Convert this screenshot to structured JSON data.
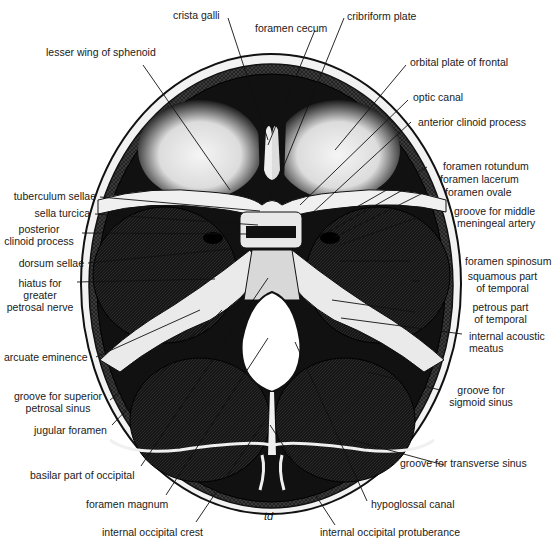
{
  "figure": {
    "signature": "td",
    "colors": {
      "ink": "#111111",
      "bone": "#f4f4f4",
      "background": "#ffffff",
      "label": "#1a1a1a"
    }
  },
  "labels": {
    "crista_galli": "crista galli",
    "foramen_cecum": "foramen cecum",
    "cribriform_plate": "cribriform plate",
    "lesser_wing": "lesser wing of sphenoid",
    "orbital_plate": "orbital plate of frontal",
    "optic_canal": "optic canal",
    "anterior_clinoid": "anterior clinoid process",
    "foramen_rotundum": "foramen rotundum",
    "foramen_lacerum": "foramen lacerum",
    "foramen_ovale": "foramen ovale",
    "groove_mma_1": "groove for middle",
    "groove_mma_2": "meningeal artery",
    "tuberculum_sellae": "tuberculum sellae",
    "sella_turcica": "sella turcica",
    "posterior_clinoid_1": "posterior",
    "posterior_clinoid_2": "clinoid process",
    "dorsum_sellae": "dorsum sellae",
    "hiatus_1": "hiatus for",
    "hiatus_2": "greater",
    "hiatus_3": "petrosal nerve",
    "foramen_spinosum": "foramen spinosum",
    "squamous_1": "squamous part",
    "squamous_2": "of temporal",
    "petrous_1": "petrous part",
    "petrous_2": "of temporal",
    "iam_1": "internal acoustic",
    "iam_2": "meatus",
    "arcuate_eminence": "arcuate eminence",
    "sup_petrosal_1": "groove for superior",
    "sup_petrosal_2": "petrosal sinus",
    "jugular_foramen": "jugular foramen",
    "sigmoid_1": "groove for",
    "sigmoid_2": "sigmoid sinus",
    "basilar_part": "basilar part of occipital",
    "transverse_sinus": "groove for transverse sinus",
    "foramen_magnum": "foramen magnum",
    "hypoglossal_canal": "hypoglossal canal",
    "internal_occipital_crest": "internal occipital crest",
    "internal_occipital_protuberance": "internal occipital protuberance"
  }
}
